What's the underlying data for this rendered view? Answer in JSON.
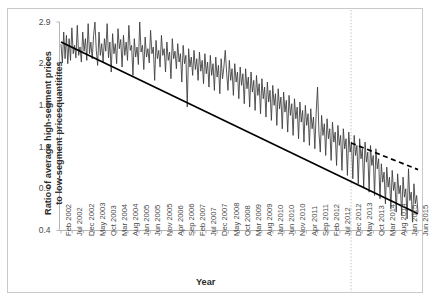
{
  "chart_data": {
    "type": "line",
    "title": "",
    "xlabel": "Year",
    "ylabel_line1": "Ratio of average high-segment prices",
    "ylabel_line2": "to low-segment pricesquantitites",
    "ylim": [
      0.4,
      2.9
    ],
    "yticks": [
      2.9,
      2.4,
      1.9,
      1.4,
      0.9,
      0.4
    ],
    "ytick_labels": [
      "2.9",
      "2.4",
      "1.9",
      "1.4",
      "0.9",
      "0.4"
    ],
    "grid": false,
    "legend": "none",
    "xtick_labels": [
      "Feb 2002",
      "Jul 2002",
      "Dec 2002",
      "May 2003",
      "Oct 2003",
      "Mar 2004",
      "Aug 2004",
      "Jan 2005",
      "Jun 2005",
      "Nov 2005",
      "Apr 2006",
      "Sep 2006",
      "Feb 2007",
      "Jul 2007",
      "Dec 2007",
      "May 2008",
      "Oct 2008",
      "Mar 2009",
      "Aug 2009",
      "Jan 2010",
      "Jun 2010",
      "Nov 2010",
      "Apr 2011",
      "Sep 2011",
      "Feb 2012",
      "Jul 2012",
      "Dec 2012",
      "May 2013",
      "Oct 2013",
      "Mar 2014",
      "Aug 2014",
      "Jan 2015",
      "Jun 2015"
    ],
    "x_start": "Feb 2002",
    "x_end": "Jun 2015",
    "series": [
      {
        "name": "Ratio of average high-segment prices to low-segment prices/quantities",
        "style": "solid-thin",
        "color": "#3a3a3a",
        "values": [
          2.63,
          2.41,
          2.78,
          2.46,
          2.74,
          2.4,
          2.7,
          2.44,
          2.83,
          2.52,
          2.62,
          2.47,
          2.86,
          2.5,
          2.6,
          2.42,
          2.78,
          2.55,
          2.7,
          2.44,
          2.88,
          2.52,
          2.66,
          2.46,
          2.74,
          2.9,
          2.56,
          2.38,
          2.78,
          2.5,
          2.64,
          2.42,
          2.7,
          2.55,
          2.88,
          2.47,
          2.66,
          2.3,
          2.76,
          2.52,
          2.64,
          2.4,
          2.82,
          2.58,
          2.69,
          2.36,
          2.74,
          2.5,
          2.66,
          2.44,
          2.86,
          2.56,
          2.62,
          2.26,
          2.7,
          2.48,
          2.6,
          2.39,
          2.9,
          2.54,
          2.62,
          2.33,
          2.72,
          2.48,
          2.58,
          2.41,
          2.8,
          2.52,
          2.6,
          2.2,
          2.68,
          2.46,
          2.56,
          2.36,
          2.74,
          2.5,
          2.58,
          2.3,
          2.66,
          2.44,
          2.54,
          2.22,
          2.7,
          2.46,
          2.55,
          2.34,
          2.64,
          2.42,
          2.52,
          2.18,
          2.62,
          2.4,
          2.5,
          1.88,
          2.58,
          2.36,
          2.48,
          2.26,
          2.56,
          2.33,
          2.46,
          2.2,
          2.54,
          2.31,
          2.44,
          2.16,
          2.52,
          2.28,
          2.42,
          2.12,
          2.5,
          2.26,
          2.4,
          2.08,
          2.48,
          2.24,
          2.38,
          2.04,
          2.46,
          2.22,
          2.36,
          2.56,
          2.3,
          2.08,
          2.44,
          2.2,
          2.34,
          2.02,
          2.4,
          2.18,
          2.3,
          1.98,
          2.36,
          2.14,
          2.28,
          1.92,
          2.34,
          2.1,
          2.24,
          1.88,
          2.3,
          2.06,
          2.2,
          1.84,
          2.26,
          2.02,
          2.16,
          1.8,
          2.22,
          1.98,
          2.12,
          1.76,
          2.18,
          1.94,
          2.08,
          1.72,
          2.14,
          1.9,
          2.04,
          1.66,
          2.1,
          1.86,
          2.0,
          1.62,
          2.06,
          1.82,
          1.96,
          1.58,
          2.02,
          1.78,
          1.92,
          1.54,
          1.98,
          1.74,
          1.88,
          1.5,
          1.94,
          1.7,
          1.84,
          1.46,
          1.9,
          1.66,
          1.8,
          1.42,
          1.86,
          1.62,
          1.76,
          1.38,
          1.82,
          2.12,
          1.58,
          1.34,
          1.78,
          1.54,
          1.68,
          1.3,
          1.74,
          1.5,
          1.62,
          1.24,
          1.7,
          1.46,
          1.58,
          1.18,
          1.66,
          1.42,
          1.54,
          1.12,
          1.62,
          1.38,
          1.5,
          1.06,
          1.58,
          1.34,
          1.46,
          1.02,
          1.54,
          1.3,
          1.42,
          0.96,
          1.5,
          1.26,
          1.38,
          0.92,
          1.46,
          1.22,
          1.34,
          0.86,
          1.42,
          1.18,
          1.3,
          0.82,
          1.38,
          1.14,
          1.26,
          0.78,
          1.2,
          0.98,
          1.1,
          0.72,
          1.16,
          0.92,
          1.04,
          0.66,
          1.12,
          0.88,
          0.98,
          0.62,
          1.08,
          0.84,
          0.94,
          0.58,
          1.04,
          0.8,
          0.9,
          0.54,
          1.14,
          0.76,
          0.86,
          0.5,
          0.96,
          0.72,
          0.82,
          0.62
        ]
      },
      {
        "name": "Trend (actual, solid)",
        "style": "solid-thick",
        "color": "#000000",
        "x0_value": "Feb 2002",
        "x1_value": "Jun 2015",
        "y0": 2.66,
        "y1": 0.6
      },
      {
        "name": "Counterfactual trend (dashed)",
        "style": "dashed",
        "color": "#000000",
        "x0_value": "Dec 2012",
        "x1_value": "Jun 2015",
        "y0": 1.45,
        "y1": 1.13
      }
    ],
    "annotations": [
      {
        "name": "structural-break-line",
        "type": "vertical-dotted-line",
        "x_value": "Dec 2012",
        "color": "#bfbfbf"
      }
    ]
  }
}
